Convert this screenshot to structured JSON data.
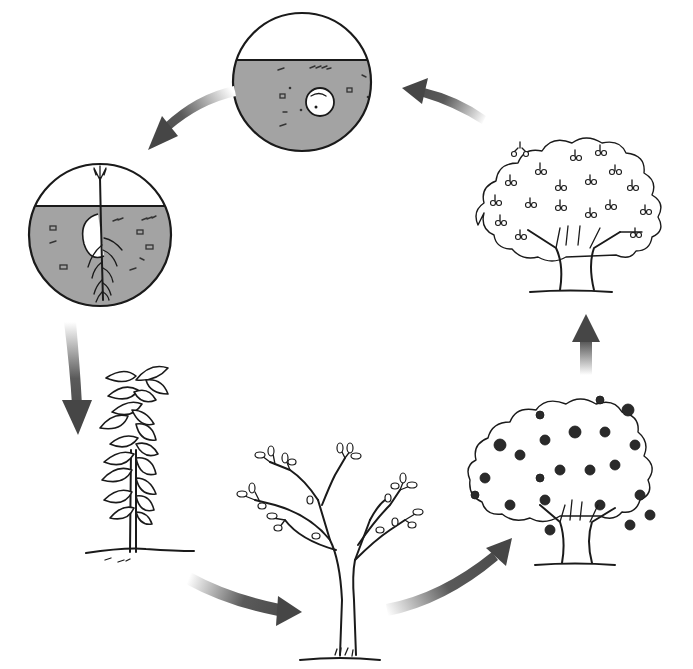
{
  "diagram": {
    "subject": "Plant life cycle",
    "colors": {
      "background": "#ffffff",
      "outline": "#1a1a1a",
      "soil": "#a3a3a3",
      "arrow": "#4a4a4a",
      "arrow_fade": "#ffffff"
    },
    "stages": [
      {
        "id": "seed",
        "depiction": "seed buried in soil (circular cutaway)",
        "shape": "circle",
        "center": [
          302,
          82
        ],
        "radius": 70
      },
      {
        "id": "germination",
        "depiction": "germinating seed with shoot and roots (circular cutaway)",
        "shape": "circle",
        "center": [
          100,
          235
        ],
        "radius": 72
      },
      {
        "id": "seedling",
        "depiction": "young leafy sapling",
        "center": [
          140,
          460
        ]
      },
      {
        "id": "young-tree",
        "depiction": "young branching tree",
        "center": [
          345,
          555
        ]
      },
      {
        "id": "mature-tree",
        "depiction": "mature tree with dense foliage",
        "center": [
          570,
          470
        ]
      },
      {
        "id": "fruiting-tree",
        "depiction": "mature tree bearing fruit",
        "center": [
          568,
          200
        ]
      }
    ],
    "arrows": [
      {
        "from": "seed",
        "to": "germination",
        "direction": "down-left"
      },
      {
        "from": "germination",
        "to": "seedling",
        "direction": "down"
      },
      {
        "from": "seedling",
        "to": "young-tree",
        "direction": "right"
      },
      {
        "from": "young-tree",
        "to": "mature-tree",
        "direction": "up-right"
      },
      {
        "from": "mature-tree",
        "to": "fruiting-tree",
        "direction": "up"
      },
      {
        "from": "fruiting-tree",
        "to": "seed",
        "direction": "up-left"
      }
    ]
  }
}
